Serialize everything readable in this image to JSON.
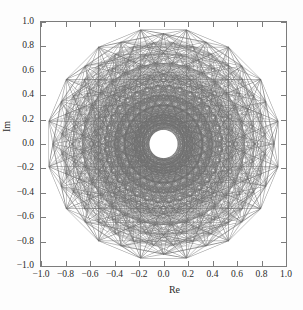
{
  "figure": {
    "background_color": "#fdfdfd",
    "plot_background_color": "#ffffff",
    "frame_color": "#7c7c7c",
    "line_color": "#6e6e6e"
  },
  "chart_data": {
    "type": "scatter",
    "title": "",
    "subtitle": "",
    "xlabel": "Re",
    "ylabel": "Im",
    "xlim": [
      -1.0,
      1.0
    ],
    "ylim": [
      -1.0,
      1.0
    ],
    "xticks": [
      -1.0,
      -0.8,
      -0.6,
      -0.4,
      -0.2,
      0.0,
      0.2,
      0.4,
      0.6,
      0.8,
      1.0
    ],
    "yticks": [
      -1.0,
      -0.8,
      -0.6,
      -0.4,
      -0.2,
      0.0,
      0.2,
      0.4,
      0.6,
      0.8,
      1.0
    ],
    "xticklabels": [
      "-1.0",
      "-0.8",
      "-0.6",
      "-0.4",
      "-0.2",
      "0.0",
      "0.2",
      "0.4",
      "0.6",
      "0.8",
      "1.0"
    ],
    "yticklabels": [
      "1.0",
      "0.8",
      "0.6",
      "0.4",
      "0.2",
      "0.0",
      "-0.2",
      "-0.4",
      "-0.6",
      "-0.8",
      "-1.0"
    ],
    "grid": false,
    "legend": null,
    "tick_direction": "in",
    "aspect": "equal",
    "series": [
      {
        "name": "chord-network",
        "color": "#6e6e6e",
        "linewidth": 0.45,
        "opacity": 0.55,
        "rings": [
          {
            "radius": 0.955,
            "count": 16,
            "phase_deg": 11.25
          },
          {
            "radius": 0.905,
            "count": 16,
            "phase_deg": 0.0
          },
          {
            "radius": 0.835,
            "count": 32,
            "phase_deg": 5.625
          },
          {
            "radius": 0.745,
            "count": 32,
            "phase_deg": 0.0
          },
          {
            "radius": 0.665,
            "count": 32,
            "phase_deg": 5.625
          },
          {
            "radius": 0.575,
            "count": 32,
            "phase_deg": 0.0
          },
          {
            "radius": 0.485,
            "count": 32,
            "phase_deg": 5.625
          },
          {
            "radius": 0.405,
            "count": 32,
            "phase_deg": 0.0
          },
          {
            "radius": 0.325,
            "count": 32,
            "phase_deg": 5.625
          },
          {
            "radius": 0.245,
            "count": 32,
            "phase_deg": 0.0
          },
          {
            "radius": 0.175,
            "count": 32,
            "phase_deg": 5.625
          },
          {
            "radius": 0.135,
            "count": 16,
            "phase_deg": 0.0
          }
        ],
        "void_radius": 0.115,
        "chord_steps": [
          1,
          2,
          3,
          5,
          7,
          9,
          11,
          13,
          15
        ],
        "radial_links": true
      }
    ]
  },
  "axes": {
    "x_title": "Re",
    "y_title": "Im"
  }
}
